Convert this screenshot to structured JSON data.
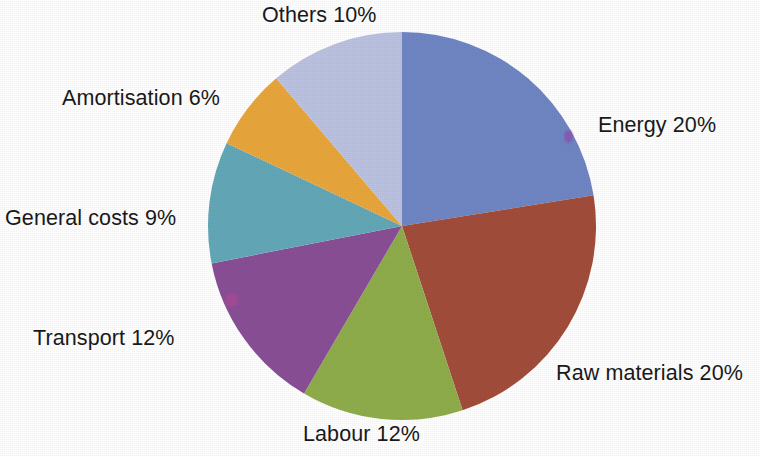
{
  "chart_data": {
    "type": "pie",
    "title": "",
    "subtitle": "",
    "xlabel": "",
    "ylabel": "",
    "legend_position": "none",
    "grid": false,
    "value_unit": "%",
    "total": 99,
    "start_angle_deg": 0,
    "direction": "clockwise",
    "center": {
      "x": 402,
      "y": 226
    },
    "radius": 194,
    "background_color": "#ffffff",
    "label_color": "#1a1a1a",
    "categories": [
      "Energy",
      "Raw materials",
      "Labour",
      "Transport",
      "General costs",
      "Amortisation",
      "Others"
    ],
    "values": [
      20,
      20,
      12,
      12,
      9,
      6,
      10
    ],
    "colors": [
      "#6f87c4",
      "#a34d3b",
      "#8fae4b",
      "#8a4f97",
      "#64a8b8",
      "#e9a63c",
      "#bcc3e2"
    ],
    "slices": [
      {
        "name": "Energy",
        "value": 20,
        "label": "Energy 20%",
        "color": "#6f87c4",
        "color_name": "blue",
        "start_pct": 0,
        "end_pct": 20
      },
      {
        "name": "Raw materials",
        "value": 20,
        "label": "Raw materials 20%",
        "color": "#a34d3b",
        "color_name": "brick-red",
        "start_pct": 20,
        "end_pct": 40
      },
      {
        "name": "Labour",
        "value": 12,
        "label": "Labour 12%",
        "color": "#8fae4b",
        "color_name": "yellow-green",
        "start_pct": 40,
        "end_pct": 52
      },
      {
        "name": "Transport",
        "value": 12,
        "label": "Transport 12%",
        "color": "#8a4f97",
        "color_name": "purple",
        "start_pct": 52,
        "end_pct": 64
      },
      {
        "name": "General costs",
        "value": 9,
        "label": "General costs 9%",
        "color": "#64a8b8",
        "color_name": "teal",
        "start_pct": 64,
        "end_pct": 73
      },
      {
        "name": "Amortisation",
        "value": 6,
        "label": "Amortisation 6%",
        "color": "#e9a63c",
        "color_name": "orange",
        "start_pct": 73,
        "end_pct": 79
      },
      {
        "name": "Others",
        "value": 10,
        "label": "Others 10%",
        "color": "#bcc3e2",
        "color_name": "light-lavender",
        "start_pct": 79,
        "end_pct": 89
      }
    ]
  },
  "labels": {
    "others": "Others 10%",
    "energy": "Energy 20%",
    "raw_materials": "Raw materials 20%",
    "labour": "Labour 12%",
    "transport": "Transport 12%",
    "general_costs": "General costs 9%",
    "amortisation": "Amortisation 6%"
  }
}
